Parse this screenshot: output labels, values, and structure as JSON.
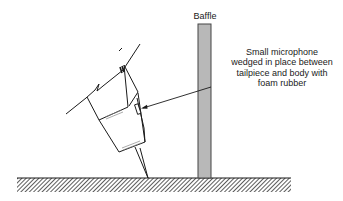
{
  "figure": {
    "labels": {
      "baffle": "Baffle",
      "callout_lines": [
        "Small microphone",
        "wedged in place between",
        "tailpiece and body with",
        "foam rubber"
      ]
    },
    "colors": {
      "line": "#1a1a1a",
      "baffle_fill": "#b8b8b8",
      "ground_hatch": "#333333",
      "background": "#ffffff"
    },
    "elements": [
      "instrument-body",
      "endpin",
      "tailpiece",
      "microphone",
      "baffle",
      "floor",
      "leader-arrow"
    ]
  }
}
